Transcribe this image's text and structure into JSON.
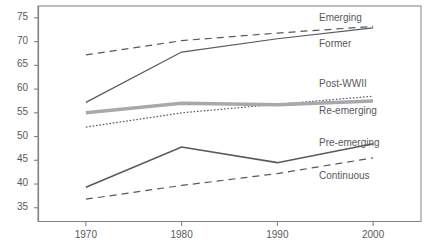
{
  "chart_data": {
    "type": "line",
    "title": "",
    "subtitle": "",
    "xlabel": "",
    "ylabel": "",
    "x": [
      1970,
      1980,
      1990,
      2000
    ],
    "xticklabels": [
      "1970",
      "1980",
      "1990",
      "2000"
    ],
    "yticks": [
      35,
      40,
      45,
      50,
      55,
      60,
      65,
      70,
      75
    ],
    "yticklabels": [
      "35",
      "40",
      "45",
      "50",
      "55",
      "60",
      "65",
      "70",
      "75"
    ],
    "xlim": [
      1965,
      2005
    ],
    "ylim": [
      32,
      77.5
    ],
    "grid": false,
    "legend_position": "inline-right",
    "series": [
      {
        "name": "Emerging",
        "values": [
          67.2,
          70.2,
          71.8,
          73.2
        ],
        "style": "dashed",
        "color": "#58595b",
        "width": 1.2,
        "label_x": 319,
        "label_y": 12
      },
      {
        "name": "Former",
        "values": [
          57.2,
          67.8,
          70.6,
          72.9
        ],
        "style": "solid",
        "color": "#58595b",
        "width": 1.2,
        "label_x": 319,
        "label_y": 38
      },
      {
        "name": "Post-WWII",
        "values": [
          52.0,
          55.0,
          56.8,
          58.5
        ],
        "style": "dotted",
        "color": "#58595b",
        "width": 1.2,
        "label_x": 319,
        "label_y": 78
      },
      {
        "name": "Re-emerging",
        "values": [
          55.0,
          57.0,
          56.7,
          57.5
        ],
        "style": "solid-thick",
        "color": "#a7a9ac",
        "width": 3.4,
        "label_x": 319,
        "label_y": 105
      },
      {
        "name": "Pre-emerging",
        "values": [
          39.3,
          47.8,
          44.5,
          48.5
        ],
        "style": "solid",
        "color": "#58595b",
        "width": 1.6,
        "label_x": 319,
        "label_y": 137
      },
      {
        "name": "Continuous",
        "values": [
          36.8,
          39.7,
          42.2,
          45.5
        ],
        "style": "dashed",
        "color": "#58595b",
        "width": 1.2,
        "label_x": 319,
        "label_y": 170
      }
    ],
    "colors": {
      "frame": "#a7a9ac",
      "axis": "#808285",
      "text": "#58595b",
      "line_dark": "#58595b",
      "line_gray": "#a7a9ac",
      "background": "#ffffff"
    }
  }
}
